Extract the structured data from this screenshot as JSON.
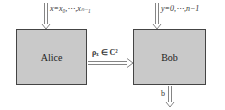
{
  "diagram": {
    "nodes": [
      {
        "id": "alice",
        "label": "Alice"
      },
      {
        "id": "bob",
        "label": "Bob"
      }
    ],
    "edges": [
      {
        "from": "input",
        "to": "alice",
        "label": "x=x₀,⋯,xₙ₋₁"
      },
      {
        "from": "input",
        "to": "bob",
        "label": "y=0,⋯,n−1"
      },
      {
        "from": "alice",
        "to": "bob",
        "label": "ρₓ ∈ C²"
      },
      {
        "from": "bob",
        "to": "output",
        "label": "b"
      }
    ],
    "colors": {
      "box_fill": "#c9c9c9",
      "box_border": "#444444",
      "arrow": "#666666"
    }
  }
}
